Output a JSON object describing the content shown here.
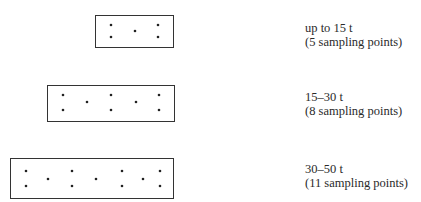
{
  "diagram": {
    "title": "",
    "groups": [
      {
        "id": "up-to-15",
        "range": "up to 15 t",
        "points_label": "(5 sampling points)",
        "sampling_points": 5
      },
      {
        "id": "15-30",
        "range": "15–30 t",
        "points_label": "(8 sampling points)",
        "sampling_points": 8
      },
      {
        "id": "30-50",
        "range": "30–50 t",
        "points_label": "(11 sampling points)",
        "sampling_points": 11
      }
    ],
    "colors": {
      "stroke": "#333333",
      "dot": "#222222",
      "text": "#2a2a2a"
    }
  }
}
